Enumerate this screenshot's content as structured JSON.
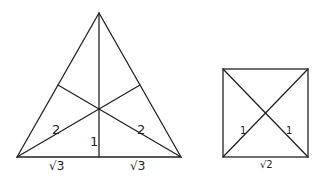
{
  "triangle": {
    "labels": {
      "left_segment": "2",
      "right_segment": "2",
      "height": "1",
      "base_left": "√3",
      "base_right": "√3"
    }
  },
  "square": {
    "labels": {
      "left_half_diagonal": "1",
      "right_half_diagonal": "1",
      "side": "√2"
    }
  },
  "colors": {
    "stroke": "#222222",
    "background": "#ffffff"
  }
}
